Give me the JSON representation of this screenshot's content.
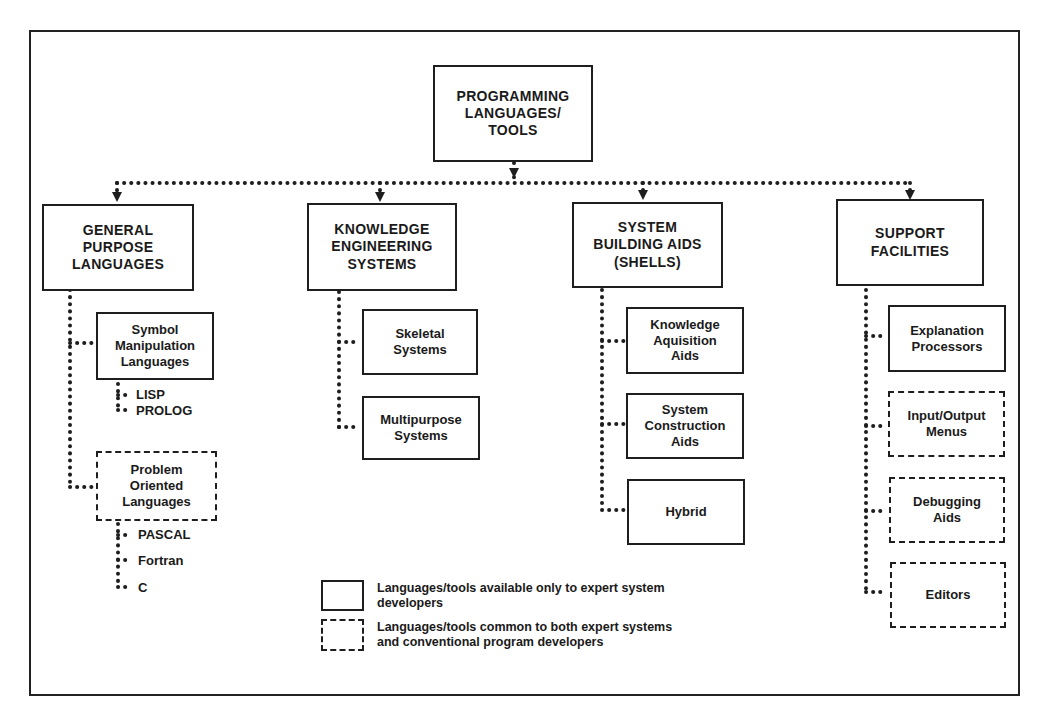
{
  "root": {
    "label": "PROGRAMMING\nLANGUAGES/\nTOOLS",
    "style": "solid"
  },
  "categories": [
    {
      "label": "GENERAL\nPURPOSE\nLANGUAGES",
      "children": [
        {
          "label": "Symbol\nManipulation\nLanguages",
          "style": "solid",
          "examples": [
            "LISP",
            "PROLOG"
          ]
        },
        {
          "label": "Problem\nOriented\nLanguages",
          "style": "dashed",
          "examples": [
            "PASCAL",
            "Fortran",
            "C"
          ]
        }
      ]
    },
    {
      "label": "KNOWLEDGE\nENGINEERING\nSYSTEMS",
      "children": [
        {
          "label": "Skeletal\nSystems",
          "style": "solid"
        },
        {
          "label": "Multipurpose\nSystems",
          "style": "solid"
        }
      ]
    },
    {
      "label": "SYSTEM\nBUILDING AIDS\n(SHELLS)",
      "children": [
        {
          "label": "Knowledge\nAquisition\nAids",
          "style": "solid"
        },
        {
          "label": "System\nConstruction\nAids",
          "style": "solid"
        },
        {
          "label": "Hybrid",
          "style": "solid"
        }
      ]
    },
    {
      "label": "SUPPORT\nFACILITIES",
      "children": [
        {
          "label": "Explanation\nProcessors",
          "style": "solid"
        },
        {
          "label": "Input/Output\nMenus",
          "style": "dashed"
        },
        {
          "label": "Debugging\nAids",
          "style": "dashed"
        },
        {
          "label": "Editors",
          "style": "dashed"
        }
      ]
    }
  ],
  "legend": {
    "solid": "Languages/tools available only to expert system\ndevelopers",
    "dashed": "Languages/tools common to both expert systems\nand conventional program developers"
  },
  "colors": {
    "ink": "#1e1e1e",
    "background": "#ffffff"
  }
}
